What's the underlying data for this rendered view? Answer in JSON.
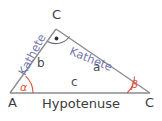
{
  "figure": {
    "background_color": "#ffffff",
    "line_color": "#8a8a92",
    "angle_color": "#e0513c",
    "kathete_color": "#7276ad",
    "text_color": "#3b3b40"
  },
  "vertices": {
    "a": {
      "label": "A",
      "x": 10,
      "y": 93
    },
    "c_top": {
      "label": "C",
      "x": 56,
      "y": 29
    },
    "c_right": {
      "label": "C",
      "x": 150,
      "y": 93
    }
  },
  "sides": {
    "a": {
      "label": "a",
      "name": "Kathete"
    },
    "b": {
      "label": "b",
      "name": "Kathete"
    },
    "c": {
      "label": "c",
      "name": "Hypotenuse"
    }
  },
  "labels": {
    "kathete_left": "Kathete",
    "kathete_right": "Kathete",
    "hypotenuse": "Hypotenuse",
    "side_a": "a",
    "side_b": "b",
    "side_c": "c",
    "vertex_a": "A",
    "vertex_c_top": "C",
    "vertex_c_right": "C"
  },
  "angles": {
    "alpha": {
      "symbol": "α",
      "at_vertex": "A"
    },
    "beta": {
      "symbol": "β",
      "at_vertex": "C"
    },
    "right_angle": {
      "symbol": "•",
      "at_vertex": "C",
      "degrees": 90
    }
  }
}
